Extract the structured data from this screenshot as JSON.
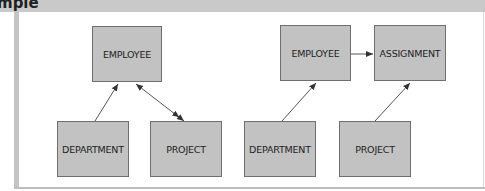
{
  "header": {
    "title_fragment": "mple"
  },
  "diagrams": [
    {
      "name": "left",
      "entities": {
        "employee": "EMPLOYEE",
        "department": "DEPARTMENT",
        "project": "PROJECT"
      },
      "relationships": [
        {
          "from": "DEPARTMENT",
          "to": "EMPLOYEE",
          "type": "single-arrow"
        },
        {
          "from": "EMPLOYEE",
          "to": "PROJECT",
          "type": "double-headed-arrow"
        }
      ]
    },
    {
      "name": "right",
      "entities": {
        "employee": "EMPLOYEE",
        "assignment": "ASSIGNMENT",
        "department": "DEPARTMENT",
        "project": "PROJECT"
      },
      "relationships": [
        {
          "from": "EMPLOYEE",
          "to": "ASSIGNMENT",
          "type": "single-arrow"
        },
        {
          "from": "DEPARTMENT",
          "to": "EMPLOYEE",
          "type": "single-arrow"
        },
        {
          "from": "PROJECT",
          "to": "ASSIGNMENT",
          "type": "single-arrow"
        }
      ]
    }
  ],
  "colors": {
    "box_fill": "#c2c2c2",
    "box_border": "#6f6f6f",
    "band": "#c9c9c9"
  }
}
